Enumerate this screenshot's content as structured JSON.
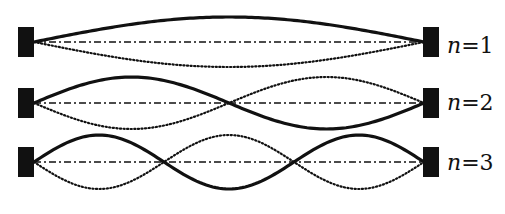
{
  "figure": {
    "colors": {
      "ink": "#111111",
      "background": "#ffffff"
    },
    "modes": [
      {
        "n": 1,
        "label_var": "n",
        "label_rest": "=1",
        "center_y": 42,
        "amplitude": 25,
        "label_y": 53
      },
      {
        "n": 2,
        "label_var": "n",
        "label_rest": "=2",
        "center_y": 103,
        "amplitude": 26,
        "label_y": 110
      },
      {
        "n": 3,
        "label_var": "n",
        "label_rest": "=3",
        "center_y": 162,
        "amplitude": 27,
        "label_y": 170
      }
    ],
    "string": {
      "x_start": 34,
      "x_end": 424
    },
    "clamps": {
      "left_x": 18,
      "right_x": 423,
      "width": 16,
      "height": 30
    },
    "line_styles": {
      "equilibrium": "dash-dot",
      "displacement_positive": "solid",
      "displacement_negative": "dotted"
    }
  }
}
